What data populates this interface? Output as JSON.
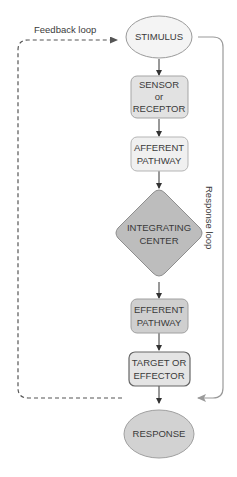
{
  "diagram": {
    "nodes": [
      {
        "id": "stimulus",
        "shape": "ellipse",
        "lines": [
          "STIMULUS"
        ],
        "fill": "#f4f4f4"
      },
      {
        "id": "sensor",
        "shape": "rounded-rect",
        "lines": [
          "SENSOR",
          "or",
          "RECEPTOR"
        ],
        "fill": "#e2e2e2"
      },
      {
        "id": "afferent",
        "shape": "rounded-rect",
        "lines": [
          "AFFERENT",
          "PATHWAY"
        ],
        "fill": "#f0f0f0"
      },
      {
        "id": "integrating",
        "shape": "diamond",
        "lines": [
          "INTEGRATING",
          "CENTER"
        ],
        "fill": "#bdbdbd"
      },
      {
        "id": "efferent",
        "shape": "rounded-rect",
        "lines": [
          "EFFERENT",
          "PATHWAY"
        ],
        "fill": "#cfcfcf"
      },
      {
        "id": "target",
        "shape": "rounded-rect",
        "lines": [
          "TARGET OR",
          "EFFECTOR"
        ],
        "fill": "#e4e4e4"
      },
      {
        "id": "response",
        "shape": "ellipse",
        "lines": [
          "RESPONSE"
        ],
        "fill": "#d2d2d2"
      }
    ],
    "edges": [
      {
        "from": "stimulus",
        "to": "sensor",
        "style": "solid"
      },
      {
        "from": "sensor",
        "to": "afferent",
        "style": "solid"
      },
      {
        "from": "afferent",
        "to": "integrating",
        "style": "solid"
      },
      {
        "from": "integrating",
        "to": "efferent",
        "style": "solid"
      },
      {
        "from": "efferent",
        "to": "target",
        "style": "solid"
      },
      {
        "from": "target",
        "to": "response",
        "style": "solid"
      },
      {
        "from": "response",
        "to": "stimulus",
        "style": "dashed",
        "label": "Feedback loop"
      },
      {
        "from": "stimulus",
        "to": "response",
        "style": "solid-gray",
        "label": "Response loop"
      }
    ],
    "labels": {
      "feedback_loop": "Feedback loop",
      "response_loop": "Response loop"
    },
    "colors": {
      "arrow": "#333333",
      "feedback_line": "#555555",
      "response_line": "#9a9a9a",
      "node_stroke": "#9a9a9a"
    }
  }
}
